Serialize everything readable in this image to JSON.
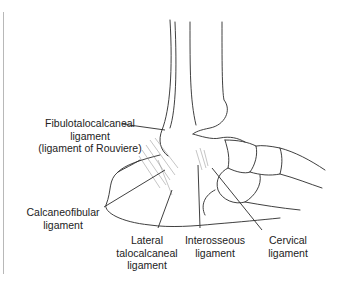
{
  "figure": {
    "labels": {
      "fibulotalocalcaneal": [
        "Fibulotalocalcaneal",
        "ligament",
        "(ligament of Rouviere)"
      ],
      "calcaneofibular": [
        "Calcaneofibular",
        "ligament"
      ],
      "lateral_talocalcaneal": [
        "Lateral",
        "talocalcaneal",
        "ligament"
      ],
      "interosseous": [
        "Interosseous",
        "ligament"
      ],
      "cervical": [
        "Cervical",
        "ligament"
      ]
    },
    "colors": {
      "line": "#2a2a2a",
      "hatch": "#8a8a8a",
      "frame": "#b8b8b8"
    }
  }
}
